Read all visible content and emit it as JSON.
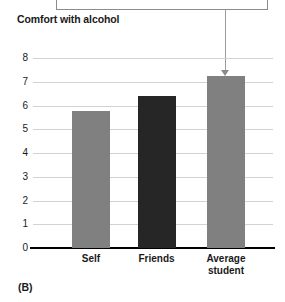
{
  "panel": {
    "label": "(B)"
  },
  "annotation": {
    "callout_text": "",
    "leader_target": "Average student",
    "arrow_icon": "down-arrow-icon"
  },
  "chart_data": {
    "type": "bar",
    "title": "Comfort with alcohol",
    "xlabel": "",
    "ylabel": "",
    "ylim": [
      0,
      8
    ],
    "yticks": [
      "0",
      "1",
      "2",
      "3",
      "4",
      "5",
      "6",
      "7",
      "8"
    ],
    "grid": true,
    "legend": "none",
    "categories": [
      "Self",
      "Friends",
      "Average student"
    ],
    "values": [
      5.75,
      6.4,
      7.25
    ],
    "colors": [
      "#808080",
      "#262626",
      "#808080"
    ],
    "series": [
      {
        "name": "Comfort with alcohol",
        "values": [
          5.75,
          6.4,
          7.25
        ]
      }
    ]
  },
  "colors": {
    "bar_gray": "#808080",
    "bar_dark": "#262626",
    "gridline": "#d2d2d2",
    "axis": "#000000",
    "text": "#1a1a1a",
    "leader": "#9a9a9a"
  }
}
